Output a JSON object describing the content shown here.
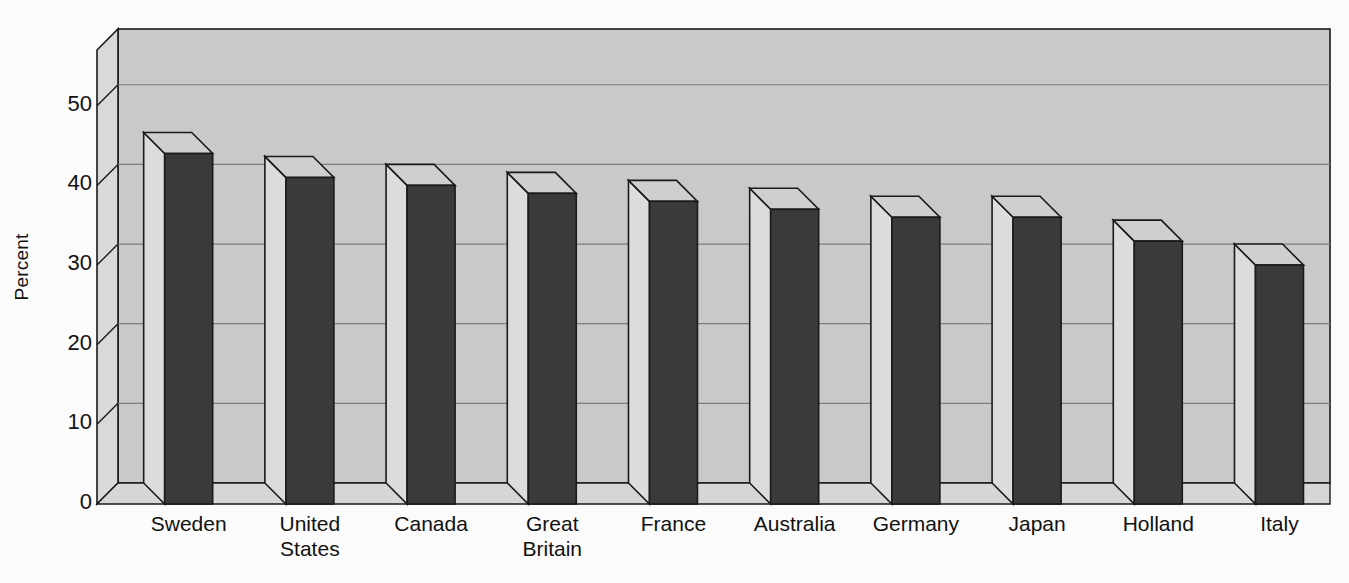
{
  "chart_data": {
    "type": "bar",
    "title": "",
    "subtitle": "",
    "xlabel": "",
    "ylabel": "Percent",
    "categories": [
      "Sweden",
      "United States",
      "Canada",
      "Great Britain",
      "France",
      "Australia",
      "Germany",
      "Japan",
      "Holland",
      "Italy"
    ],
    "values": [
      44,
      41,
      40,
      39,
      38,
      37,
      36,
      36,
      33,
      30
    ],
    "ylim": [
      0,
      57
    ],
    "yticks": [
      0,
      10,
      20,
      30,
      40,
      50
    ],
    "ytick_labels": [
      "0",
      "10",
      "20",
      "30",
      "40",
      "50"
    ],
    "grid": true,
    "grid_axis": "y",
    "legend": "none",
    "style": "3d-bar",
    "bar_color": "#3a3a3a",
    "wall_color": "#c9c9c9",
    "floor_color": "#d6d6d6",
    "grid_color": "#7d7d7d",
    "axis_color": "#1a1a1a"
  },
  "axis": {
    "y_title": "Percent"
  },
  "categories_display": [
    {
      "label": "Sweden"
    },
    {
      "label": "United\nStates"
    },
    {
      "label": "Canada"
    },
    {
      "label": "Great\nBritain"
    },
    {
      "label": "France"
    },
    {
      "label": "Australia"
    },
    {
      "label": "Germany"
    },
    {
      "label": "Japan"
    },
    {
      "label": "Holland"
    },
    {
      "label": "Italy"
    }
  ]
}
